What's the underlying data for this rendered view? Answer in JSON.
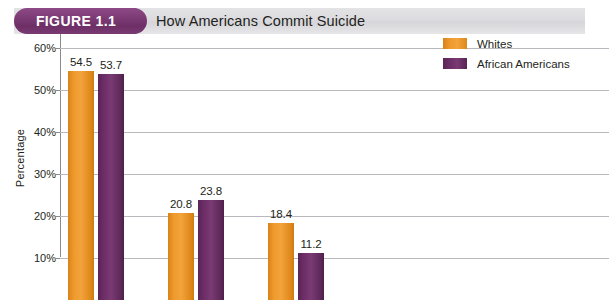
{
  "figure": {
    "badge_label": "FIGURE 1.1",
    "title": "How Americans Commit Suicide"
  },
  "legend": {
    "items": [
      {
        "label": "Whites",
        "color": "#ef9a2c"
      },
      {
        "label": "African Americans",
        "color": "#6e2f69"
      }
    ]
  },
  "axis": {
    "y_title": "Percentage",
    "ticks": [
      "60%",
      "50%",
      "40%",
      "30%",
      "20%",
      "10%"
    ]
  },
  "chart_data": {
    "type": "bar",
    "title": "How Americans Commit Suicide",
    "xlabel": "",
    "ylabel": "Percentage",
    "ylim": [
      0,
      60
    ],
    "ytick_values": [
      60,
      50,
      40,
      30,
      20,
      10
    ],
    "grid": true,
    "legend_position": "top-right",
    "categories": [
      "Group 1",
      "Group 2",
      "Group 3"
    ],
    "series": [
      {
        "name": "Whites",
        "color": "#ef9a2c",
        "values": [
          54.5,
          20.8,
          18.4
        ]
      },
      {
        "name": "African Americans",
        "color": "#6e2f69",
        "values": [
          53.7,
          23.8,
          11.2
        ]
      }
    ],
    "data_labels": [
      "54.5",
      "53.7",
      "20.8",
      "23.8",
      "18.4",
      "11.2"
    ],
    "note": "Chart is cropped at the bottom; x-axis category labels and lower portion below 10% are not visible."
  },
  "bars": [
    {
      "label": "54.5",
      "value": 54.5,
      "series": "Whites",
      "x": 8,
      "w": 26
    },
    {
      "label": "53.7",
      "value": 53.7,
      "series": "African Americans",
      "x": 38,
      "w": 26
    },
    {
      "label": "20.8",
      "value": 20.8,
      "series": "Whites",
      "x": 108,
      "w": 26
    },
    {
      "label": "23.8",
      "value": 23.8,
      "series": "African Americans",
      "x": 138,
      "w": 26
    },
    {
      "label": "18.4",
      "value": 18.4,
      "series": "Whites",
      "x": 208,
      "w": 26
    },
    {
      "label": "11.2",
      "value": 11.2,
      "series": "African Americans",
      "x": 238,
      "w": 26
    }
  ]
}
